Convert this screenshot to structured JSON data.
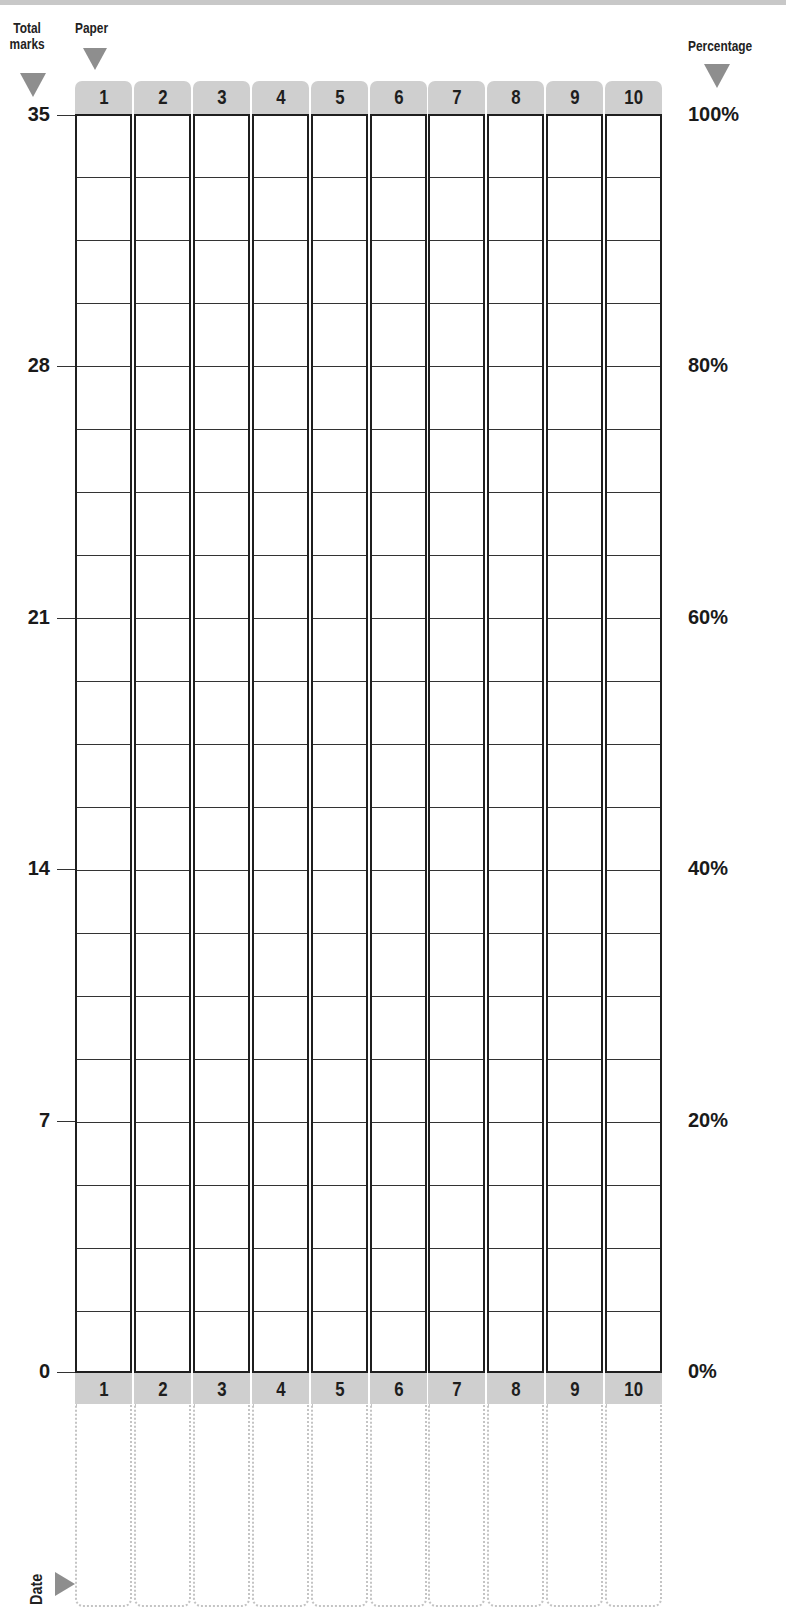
{
  "chart_data": {
    "type": "table",
    "title": "",
    "left_axis": {
      "label": "Total marks",
      "ticks": [
        "35",
        "28",
        "21",
        "14",
        "7",
        "0"
      ],
      "tick_values": [
        35,
        28,
        21,
        14,
        7,
        0
      ],
      "range": [
        0,
        35
      ],
      "minor_step": 1
    },
    "right_axis": {
      "label": "Percentage",
      "ticks": [
        "100%",
        "80%",
        "60%",
        "40%",
        "20%",
        "0%"
      ],
      "tick_values": [
        100,
        80,
        60,
        40,
        20,
        0
      ],
      "range": [
        0,
        100
      ]
    },
    "x_axis": {
      "label": "Paper",
      "categories": [
        "1",
        "2",
        "3",
        "4",
        "5",
        "6",
        "7",
        "8",
        "9",
        "10"
      ]
    },
    "bottom_row_label": "Date",
    "values": [
      null,
      null,
      null,
      null,
      null,
      null,
      null,
      null,
      null,
      null
    ],
    "grid": true,
    "legend": null
  },
  "labels": {
    "total_marks_line1": "Total",
    "total_marks_line2": "marks",
    "paper": "Paper",
    "percentage": "Percentage",
    "date": "Date"
  },
  "left_ticks": [
    "35",
    "28",
    "21",
    "14",
    "7",
    "0"
  ],
  "right_ticks": [
    "100%",
    "80%",
    "60%",
    "40%",
    "20%",
    "0%"
  ],
  "papers_top": [
    "1",
    "2",
    "3",
    "4",
    "5",
    "6",
    "7",
    "8",
    "9",
    "10"
  ],
  "papers_bottom": [
    "1",
    "2",
    "3",
    "4",
    "5",
    "6",
    "7",
    "8",
    "9",
    "10"
  ],
  "colors": {
    "tab_fill": "#cfcfcf",
    "arrow_fill": "#8e8e8e",
    "grid_line": "#1f1f1f",
    "date_border": "#c4c4c4"
  }
}
